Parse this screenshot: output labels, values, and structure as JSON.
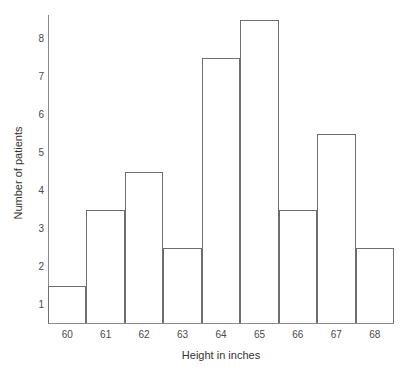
{
  "chart_data": {
    "type": "bar",
    "title": "",
    "subtitle": "",
    "xlabel": "Height in inches",
    "ylabel": "Number of patients",
    "categories": [
      "60",
      "61",
      "62",
      "63",
      "64",
      "65",
      "66",
      "67",
      "68"
    ],
    "values": [
      1.5,
      3.5,
      4.5,
      2.5,
      7.5,
      8.5,
      3.5,
      5.5,
      2.5
    ],
    "series": [
      {
        "name": "Number of patients",
        "values": [
          1.5,
          3.5,
          4.5,
          2.5,
          7.5,
          8.5,
          3.5,
          5.5,
          2.5
        ]
      }
    ],
    "y_ticks": [
      1,
      2,
      3,
      4,
      5,
      6,
      7,
      8
    ],
    "y_tick_labels": [
      "1",
      "2",
      "3",
      "4",
      "5",
      "6",
      "7",
      "8"
    ],
    "x_tick_labels": [
      "60",
      "61",
      "62",
      "63",
      "64",
      "65",
      "66",
      "67",
      "68"
    ],
    "ylim": [
      0.5,
      8.9
    ],
    "xlim": [
      59.5,
      68.5
    ],
    "bin_width": 1,
    "bin_edges": [
      59.5,
      60.5,
      61.5,
      62.5,
      63.5,
      64.5,
      65.5,
      66.5,
      67.5,
      68.5
    ],
    "grid": false,
    "legend": null,
    "legend_position": "none",
    "annotations": [],
    "colors": {
      "bar_fill": "transparent",
      "bar_stroke": "#6e6e6e",
      "axis": "#8a8a8a",
      "text": "#333333",
      "tick_text": "#4a4a4a",
      "background": "#ffffff"
    }
  }
}
